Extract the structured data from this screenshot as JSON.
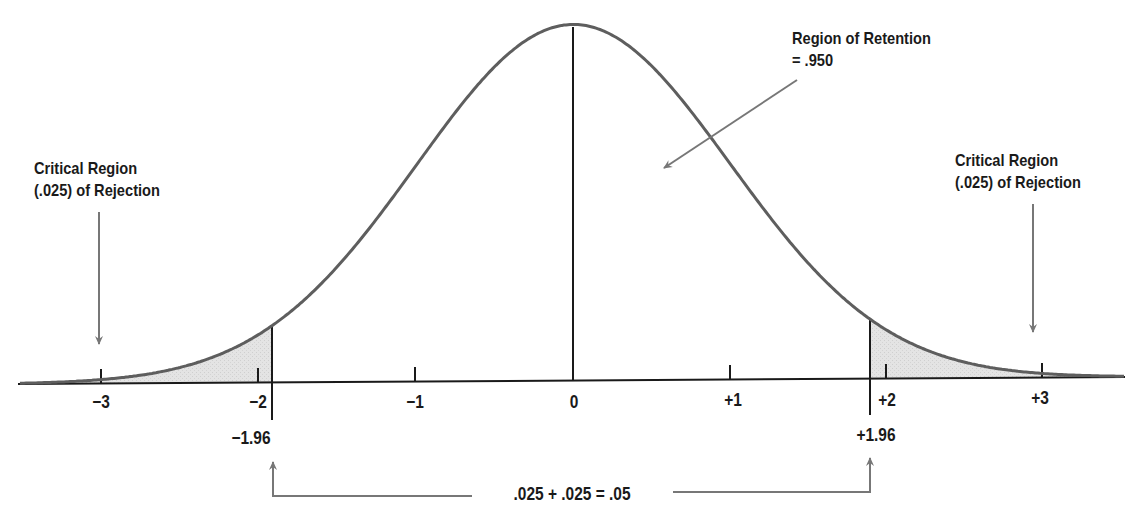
{
  "chart_data": {
    "type": "area",
    "title": "",
    "x_axis": {
      "label": "",
      "ticks": [
        "-3",
        "-2",
        "-1",
        "0",
        "+1",
        "+2",
        "+3"
      ],
      "tick_values": [
        -3,
        -2,
        -1,
        0,
        1,
        2,
        3
      ],
      "range": [
        -3.5,
        3.5
      ]
    },
    "y_axis": {
      "visible": false
    },
    "grid": false,
    "curve": {
      "distribution": "normal",
      "mean": 0,
      "sd": 1
    },
    "critical_values": [
      -1.96,
      1.96
    ],
    "regions": [
      {
        "name": "Critical Region (.025) of Rejection",
        "from": "-inf",
        "to": -1.96,
        "area": 0.025,
        "shaded": true
      },
      {
        "name": "Region of Retention",
        "from": -1.96,
        "to": 1.96,
        "area": 0.95,
        "shaded": false
      },
      {
        "name": "Critical Region (.025) of Rejection",
        "from": 1.96,
        "to": "inf",
        "area": 0.025,
        "shaded": true
      }
    ],
    "annotations": [
      "Critical Region (.025) of Rejection",
      "Region of Retention = .950",
      "Critical Region (.025) of Rejection",
      "-1.96",
      "+1.96",
      ".025 + .025 = .05"
    ],
    "colors": {
      "curve": "#5a5a5a",
      "shade": "#e2e2e2",
      "axis": "#1a1a1a",
      "arrows": "#777777"
    }
  },
  "labels": {
    "left_region_line1": "Critical Region",
    "left_region_line2": "(.025) of Rejection",
    "right_region_line1": "Critical Region",
    "right_region_line2": "(.025) of Rejection",
    "retention_line1": "Region of Retention",
    "retention_line2": "= .950",
    "crit_left": "−1.96",
    "crit_right": "+1.96",
    "sum": ".025 + .025 = .05"
  },
  "ticks": {
    "m3": "−3",
    "m2": "−2",
    "m1": "−1",
    "zero": "0",
    "p1": "+1",
    "p2": "+2",
    "p3": "+3"
  }
}
